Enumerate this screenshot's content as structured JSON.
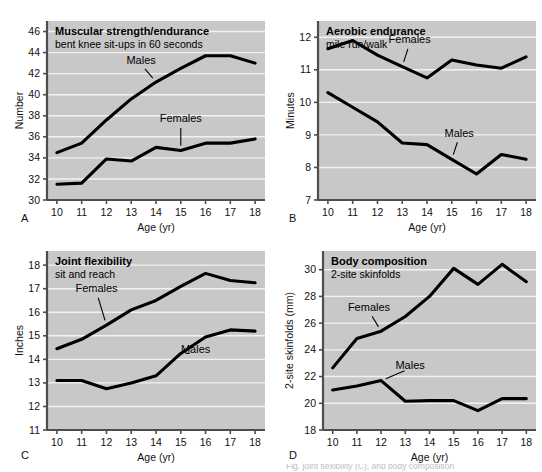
{
  "figure": {
    "panel_letters": [
      "A",
      "B",
      "C",
      "D"
    ],
    "bottom_caption_fragment": "Fig. joint flexibility (C), and body composition",
    "plot_background_color": "#c8c8c8",
    "gridline_color": "#f2f2f2",
    "line_color": "#000000",
    "axis_color": "#4d4d4d"
  },
  "chart_data": [
    {
      "panel": "A",
      "type": "line",
      "title": "Muscular strength/endurance",
      "subtitle": "bent knee sit-ups in 60 seconds",
      "xlabel": "Age (yr)",
      "ylabel": "Number",
      "x": [
        10,
        11,
        12,
        13,
        14,
        15,
        16,
        17,
        18
      ],
      "xticklabels": [
        "10",
        "11",
        "12",
        "13",
        "14",
        "15",
        "16",
        "17",
        "18"
      ],
      "yticks": [
        30,
        32,
        34,
        36,
        38,
        40,
        42,
        44,
        46
      ],
      "yticklabels": [
        "30",
        "32",
        "34",
        "36",
        "38",
        "40",
        "42",
        "44",
        "46"
      ],
      "xlim": [
        9.6,
        18.4
      ],
      "ylim": [
        30,
        47
      ],
      "grid": true,
      "legend": "inline-labels",
      "series": [
        {
          "name": "Males",
          "values": [
            34.5,
            35.4,
            37.6,
            39.6,
            41.2,
            42.5,
            43.7,
            43.7,
            43.0
          ],
          "label_x": 13.4,
          "label_y": 42.9
        },
        {
          "name": "Females",
          "values": [
            31.5,
            31.6,
            33.9,
            33.7,
            35.0,
            34.7,
            35.4,
            35.4,
            35.8
          ],
          "label_x": 15.0,
          "label_y": 37.4
        }
      ],
      "annotations": [
        {
          "text": "Males",
          "leader": true
        },
        {
          "text": "Females",
          "leader": true
        }
      ]
    },
    {
      "panel": "B",
      "type": "line",
      "title": "Aerobic endurance",
      "subtitle": "mile run/walk",
      "xlabel": "Age (yr)",
      "ylabel": "Minutes",
      "x": [
        10,
        11,
        12,
        13,
        14,
        15,
        16,
        17,
        18
      ],
      "xticklabels": [
        "10",
        "11",
        "12",
        "13",
        "14",
        "15",
        "16",
        "17",
        "18"
      ],
      "yticks": [
        7,
        8,
        9,
        10,
        11,
        12
      ],
      "yticklabels": [
        "7",
        "8",
        "9",
        "10",
        "11",
        "12"
      ],
      "xlim": [
        9.6,
        18.4
      ],
      "ylim": [
        7,
        12.5
      ],
      "grid": true,
      "legend": "inline-labels",
      "series": [
        {
          "name": "Females",
          "values": [
            11.65,
            11.9,
            11.45,
            11.1,
            10.75,
            11.3,
            11.15,
            11.05,
            11.4
          ],
          "label_x": 13.3,
          "label_y": 11.82
        },
        {
          "name": "Males",
          "values": [
            10.3,
            9.85,
            9.4,
            8.75,
            8.7,
            8.25,
            7.8,
            8.4,
            8.25
          ],
          "label_x": 15.3,
          "label_y": 8.95
        }
      ],
      "annotations": [
        {
          "text": "Females",
          "leader": true
        },
        {
          "text": "Males",
          "leader": true
        }
      ]
    },
    {
      "panel": "C",
      "type": "line",
      "title": "Joint flexibility",
      "subtitle": "sit and reach",
      "xlabel": "Age (yr)",
      "ylabel": "Inches",
      "x": [
        10,
        11,
        12,
        13,
        14,
        15,
        16,
        17,
        18
      ],
      "xticklabels": [
        "10",
        "11",
        "12",
        "13",
        "14",
        "15",
        "16",
        "17",
        "18"
      ],
      "yticks": [
        11,
        12,
        13,
        14,
        15,
        16,
        17,
        18
      ],
      "yticklabels": [
        "11",
        "12",
        "13",
        "14",
        "15",
        "16",
        "17",
        "18"
      ],
      "xlim": [
        9.6,
        18.4
      ],
      "ylim": [
        11,
        18.6
      ],
      "grid": true,
      "legend": "inline-labels",
      "series": [
        {
          "name": "Females",
          "values": [
            14.45,
            14.85,
            15.45,
            16.1,
            16.5,
            17.1,
            17.65,
            17.35,
            17.25
          ],
          "label_x": 11.6,
          "label_y": 16.85
        },
        {
          "name": "Males",
          "values": [
            13.1,
            13.1,
            12.75,
            13.0,
            13.3,
            14.25,
            14.95,
            15.25,
            15.2
          ],
          "label_x": 15.6,
          "label_y": 14.25
        }
      ],
      "annotations": [
        {
          "text": "Females",
          "leader": true
        },
        {
          "text": "Males",
          "leader": true
        }
      ]
    },
    {
      "panel": "D",
      "type": "line",
      "title": "Body composition",
      "subtitle": "2-site skinfolds",
      "xlabel": "Age (yr)",
      "ylabel": "2-site skinfolds (mm)",
      "x": [
        10,
        11,
        12,
        13,
        14,
        15,
        16,
        17,
        18
      ],
      "xticklabels": [
        "10",
        "11",
        "12",
        "13",
        "14",
        "15",
        "16",
        "17",
        "18"
      ],
      "yticks": [
        18,
        20,
        22,
        24,
        26,
        28,
        30
      ],
      "yticklabels": [
        "18",
        "20",
        "22",
        "24",
        "26",
        "28",
        "30"
      ],
      "xlim": [
        9.6,
        18.4
      ],
      "ylim": [
        18,
        31.4
      ],
      "grid": true,
      "legend": "inline-labels",
      "series": [
        {
          "name": "Females",
          "values": [
            22.65,
            24.85,
            25.4,
            26.5,
            28.0,
            30.1,
            28.9,
            30.4,
            29.1
          ],
          "label_x": 11.5,
          "label_y": 26.9
        },
        {
          "name": "Males",
          "values": [
            21.0,
            21.3,
            21.7,
            20.15,
            20.2,
            20.2,
            19.45,
            20.35,
            20.35
          ],
          "label_x": 13.2,
          "label_y": 22.6
        }
      ],
      "annotations": [
        {
          "text": "Females",
          "leader": true
        },
        {
          "text": "Males",
          "leader": true
        }
      ]
    }
  ]
}
